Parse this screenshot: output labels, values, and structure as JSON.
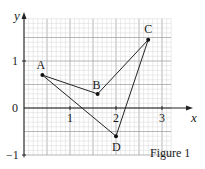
{
  "figure": {
    "caption": "Figure 1",
    "axes": {
      "x_label": "x",
      "y_label": "y",
      "x_ticks": [
        "1",
        "2",
        "3"
      ],
      "y_ticks": [
        "1",
        "0",
        "-1"
      ],
      "x_range": [
        0,
        3.3
      ],
      "y_range": [
        -1,
        2
      ]
    },
    "grid": {
      "minor_step": 0.1,
      "major_step": 0.5,
      "color": "#bbbbbb"
    },
    "points": [
      {
        "label": "A",
        "x": 0.4,
        "y": 0.7
      },
      {
        "label": "B",
        "x": 1.6,
        "y": 0.3
      },
      {
        "label": "C",
        "x": 2.7,
        "y": 1.45
      },
      {
        "label": "D",
        "x": 2.0,
        "y": -0.6
      }
    ],
    "segments": [
      [
        "A",
        "B"
      ],
      [
        "B",
        "C"
      ],
      [
        "C",
        "D"
      ],
      [
        "D",
        "A"
      ]
    ]
  },
  "chart_data": {
    "type": "scatter",
    "title": "Figure 1",
    "xlabel": "x",
    "ylabel": "y",
    "x_ticks": [
      1,
      2,
      3
    ],
    "y_ticks": [
      -1,
      0,
      1
    ],
    "xlim": [
      0,
      3.3
    ],
    "ylim": [
      -1,
      2
    ],
    "grid": true,
    "series": [
      {
        "name": "quadrilateral ABCD",
        "points": [
          {
            "label": "A",
            "x": 0.4,
            "y": 0.7
          },
          {
            "label": "B",
            "x": 1.6,
            "y": 0.3
          },
          {
            "label": "C",
            "x": 2.7,
            "y": 1.45
          },
          {
            "label": "D",
            "x": 2.0,
            "y": -0.6
          }
        ],
        "edges": [
          [
            "A",
            "B"
          ],
          [
            "B",
            "C"
          ],
          [
            "C",
            "D"
          ],
          [
            "D",
            "A"
          ]
        ]
      }
    ]
  }
}
